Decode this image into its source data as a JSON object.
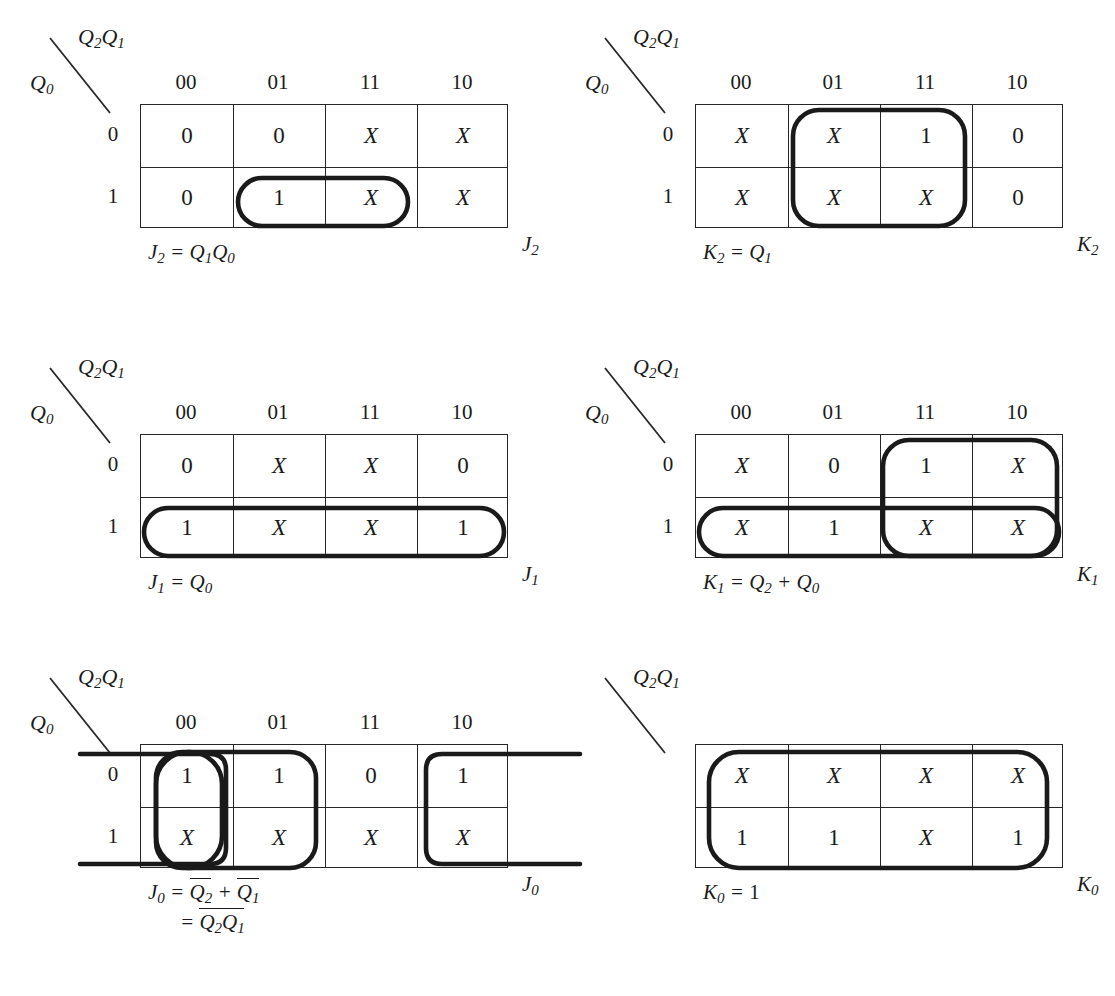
{
  "figure": {
    "axis_top_label": "Q2Q1",
    "axis_left_label": "Q0",
    "col_headers": [
      "00",
      "01",
      "11",
      "10"
    ],
    "row_labels": [
      "0",
      "1"
    ]
  },
  "maps": [
    {
      "id": "j2",
      "output": "J2",
      "equation": "J2 = Q1Q0",
      "show_headers": true,
      "rows": [
        [
          "0",
          "0",
          "X",
          "X"
        ],
        [
          "0",
          "1",
          "X",
          "X"
        ]
      ]
    },
    {
      "id": "k2",
      "output": "K2",
      "equation": "K2 = Q1",
      "show_headers": true,
      "rows": [
        [
          "X",
          "X",
          "1",
          "0"
        ],
        [
          "X",
          "X",
          "X",
          "0"
        ]
      ]
    },
    {
      "id": "j1",
      "output": "J1",
      "equation": "J1 = Q0",
      "show_headers": true,
      "rows": [
        [
          "0",
          "X",
          "X",
          "0"
        ],
        [
          "1",
          "X",
          "X",
          "1"
        ]
      ]
    },
    {
      "id": "k1",
      "output": "K1",
      "equation": "K1 = Q2 + Q0",
      "show_headers": true,
      "rows": [
        [
          "X",
          "0",
          "1",
          "X"
        ],
        [
          "X",
          "1",
          "X",
          "X"
        ]
      ]
    },
    {
      "id": "j0",
      "output": "J0",
      "equation_line1": "J0 = Q2 + Q1",
      "equation_line2": "= Q2Q1",
      "show_headers": true,
      "rows": [
        [
          "1",
          "1",
          "0",
          "1"
        ],
        [
          "X",
          "X",
          "X",
          "X"
        ]
      ]
    },
    {
      "id": "k0",
      "output": "K0",
      "equation": "K0 = 1",
      "show_headers": false,
      "rows": [
        [
          "X",
          "X",
          "X",
          "X"
        ],
        [
          "1",
          "1",
          "X",
          "1"
        ]
      ]
    }
  ]
}
